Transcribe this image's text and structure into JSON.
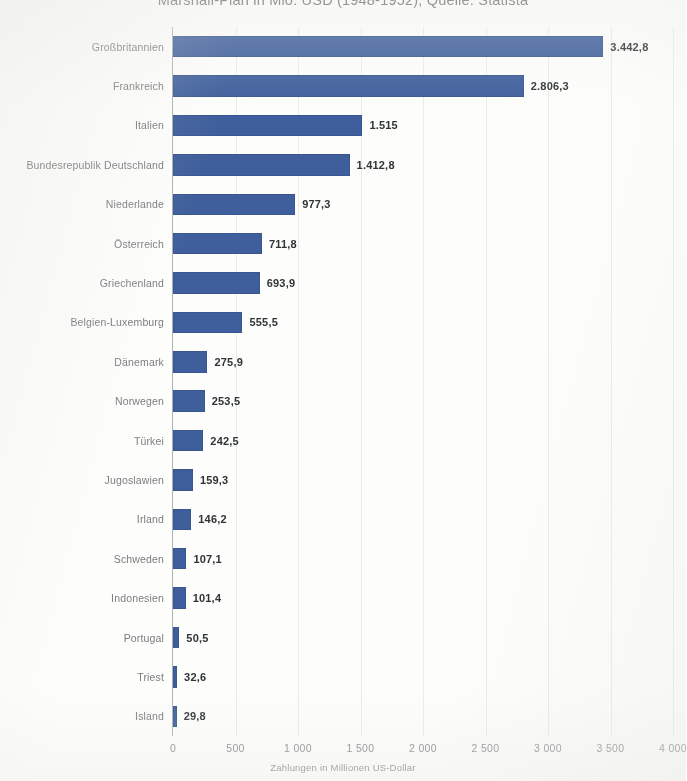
{
  "chart_title": "Marshall-Plan in Mio. USD (1948-1952), Quelle: Statista",
  "xaxis_caption": "Zahlungen in Millionen US-Dollar",
  "colors": {
    "bar": "#3f5f9c",
    "axis": "#9ea6ac",
    "grid": "#d8dcd6",
    "label_text": "#6c7072",
    "value_text": "#2f3437",
    "background": "#fdfdfb"
  },
  "chart_data": {
    "type": "bar",
    "orientation": "horizontal",
    "title": "Marshall-Plan in Mio. USD (1948-1952), Quelle: Statista",
    "xlabel": "Zahlungen in Millionen US-Dollar",
    "ylabel": "",
    "xlim": [
      0,
      4000
    ],
    "grid": true,
    "legend": false,
    "tick_labels": [
      "0",
      "500",
      "1 000",
      "1 500",
      "2 000",
      "2 500",
      "3 000",
      "3 500",
      "4 000"
    ],
    "ticks": [
      0,
      500,
      1000,
      1500,
      2000,
      2500,
      3000,
      3500,
      4000
    ],
    "categories": [
      "Großbritannien",
      "Frankreich",
      "Italien",
      "Bundesrepublik Deutschland",
      "Niederlande",
      "Österreich",
      "Griechenland",
      "Belgien-Luxemburg",
      "Dänemark",
      "Norwegen",
      "Türkei",
      "Jugoslawien",
      "Irland",
      "Schweden",
      "Indonesien",
      "Portugal",
      "Triest",
      "Island"
    ],
    "values": [
      3442.8,
      2806.3,
      1515,
      1412.8,
      977.3,
      711.8,
      693.9,
      555.5,
      275.9,
      253.5,
      242.5,
      159.3,
      146.2,
      107.1,
      101.4,
      50.5,
      32.6,
      29.8
    ],
    "value_labels": [
      "3.442,8",
      "2.806,3",
      "1.515",
      "1.412,8",
      "977,3",
      "711,8",
      "693,9",
      "555,5",
      "275,9",
      "253,5",
      "242,5",
      "159,3",
      "146,2",
      "107,1",
      "101,4",
      "50,5",
      "32,6",
      "29,8"
    ]
  }
}
